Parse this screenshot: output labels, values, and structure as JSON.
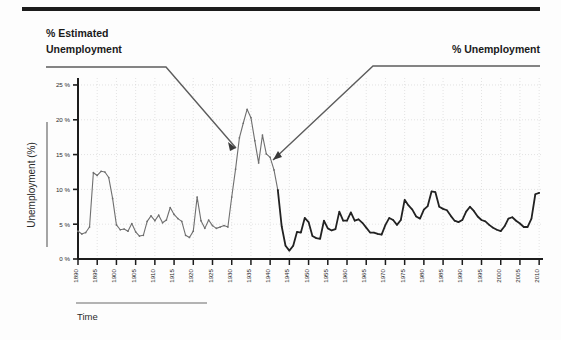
{
  "figure": {
    "top_rule": true,
    "time_axis_label": "Time",
    "y_axis_title": "Unemployment (%)"
  },
  "annotations": [
    {
      "name": "estimated-unemployment-callout",
      "text_line1": "% Estimated",
      "text_line2": "Unemployment",
      "points_to_year": 1931,
      "points_to_value": 17.4
    },
    {
      "name": "unemployment-callout",
      "text_line1": "% Unemployment",
      "text_line2": "",
      "points_to_year": 1941,
      "points_to_value": 12.8
    }
  ],
  "chart_data": {
    "type": "line",
    "title": "",
    "subtitle": "",
    "xlabel": "Time",
    "ylabel": "Unemployment (%)",
    "xlim": [
      1890,
      2011
    ],
    "ylim": [
      0,
      26
    ],
    "grid": true,
    "legend_position": "none",
    "y_ticks": [
      0,
      5,
      10,
      15,
      20,
      25
    ],
    "y_tick_labels": [
      "0 %",
      "5 %",
      "10 %",
      "15 %",
      "20 %",
      "25 %"
    ],
    "x_ticks": [
      1890,
      1895,
      1900,
      1905,
      1910,
      1915,
      1920,
      1925,
      1930,
      1935,
      1940,
      1945,
      1950,
      1955,
      1960,
      1965,
      1970,
      1975,
      1980,
      1985,
      1990,
      1995,
      2000,
      2005,
      2010
    ],
    "x_tick_labels": [
      "1890",
      "1895",
      "1900",
      "1905",
      "1910",
      "1915",
      "1920",
      "1925",
      "1930",
      "1935",
      "1940",
      "1945",
      "1950",
      "1955",
      "1960",
      "1965",
      "1970",
      "1975",
      "1980",
      "1985",
      "1990",
      "1995",
      "2000",
      "2005",
      "2010"
    ],
    "series": [
      {
        "name": "% Estimated Unemployment",
        "color": "#6f6f6f",
        "linewidth": 1.1,
        "markers": true,
        "x": [
          1890,
          1891,
          1892,
          1893,
          1894,
          1895,
          1896,
          1897,
          1898,
          1899,
          1900,
          1901,
          1902,
          1903,
          1904,
          1905,
          1906,
          1907,
          1908,
          1909,
          1910,
          1911,
          1912,
          1913,
          1914,
          1915,
          1916,
          1917,
          1918,
          1919,
          1920,
          1921,
          1922,
          1923,
          1924,
          1925,
          1926,
          1927,
          1928,
          1929,
          1930,
          1931,
          1932,
          1933,
          1934,
          1935,
          1936,
          1937,
          1938,
          1939,
          1940,
          1941,
          1942
        ],
        "y": [
          4.0,
          3.6,
          3.8,
          4.6,
          12.4,
          12.0,
          12.6,
          12.5,
          11.7,
          8.7,
          4.9,
          4.2,
          4.3,
          4.0,
          5.1,
          3.9,
          3.3,
          3.4,
          5.4,
          6.2,
          5.5,
          6.3,
          5.2,
          5.6,
          7.4,
          6.4,
          5.8,
          5.4,
          3.4,
          3.1,
          4.0,
          8.9,
          5.5,
          4.4,
          5.6,
          4.8,
          4.4,
          4.6,
          4.8,
          4.6,
          8.9,
          12.9,
          17.4,
          19.5,
          21.5,
          20.3,
          17.0,
          13.8,
          17.8,
          15.1,
          14.6,
          12.8,
          9.9
        ]
      },
      {
        "name": "% Unemployment",
        "color": "#222222",
        "linewidth": 1.8,
        "markers": true,
        "x": [
          1942,
          1943,
          1944,
          1945,
          1946,
          1947,
          1948,
          1949,
          1950,
          1951,
          1952,
          1953,
          1954,
          1955,
          1956,
          1957,
          1958,
          1959,
          1960,
          1961,
          1962,
          1963,
          1964,
          1965,
          1966,
          1967,
          1968,
          1969,
          1970,
          1971,
          1972,
          1973,
          1974,
          1975,
          1976,
          1977,
          1978,
          1979,
          1980,
          1981,
          1982,
          1983,
          1984,
          1985,
          1986,
          1987,
          1988,
          1989,
          1990,
          1991,
          1992,
          1993,
          1994,
          1995,
          1996,
          1997,
          1998,
          1999,
          2000,
          2001,
          2002,
          2003,
          2004,
          2005,
          2006,
          2007,
          2008,
          2009,
          2010
        ],
        "y": [
          9.9,
          4.7,
          1.9,
          1.2,
          1.9,
          3.9,
          3.8,
          5.9,
          5.3,
          3.3,
          3.0,
          2.9,
          5.5,
          4.4,
          4.1,
          4.3,
          6.8,
          5.5,
          5.5,
          6.7,
          5.5,
          5.7,
          5.2,
          4.5,
          3.8,
          3.8,
          3.6,
          3.5,
          4.9,
          5.9,
          5.6,
          4.9,
          5.6,
          8.5,
          7.7,
          7.1,
          6.1,
          5.8,
          7.1,
          7.6,
          9.7,
          9.6,
          7.5,
          7.2,
          7.0,
          6.2,
          5.5,
          5.3,
          5.6,
          6.8,
          7.5,
          6.9,
          6.1,
          5.6,
          5.4,
          4.9,
          4.5,
          4.2,
          4.0,
          4.7,
          5.8,
          6.0,
          5.5,
          5.1,
          4.6,
          4.6,
          5.8,
          9.3,
          9.5
        ]
      }
    ]
  }
}
